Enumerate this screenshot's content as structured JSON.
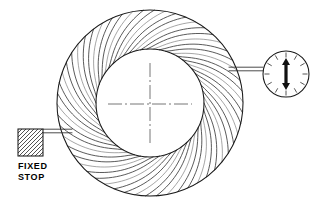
{
  "diagram": {
    "type": "mechanical-schematic",
    "canvas": {
      "width": 319,
      "height": 209,
      "background": "#ffffff"
    },
    "line_color": "#1a1a1a"
  },
  "wheel": {
    "name": "impeller-wheel",
    "center_x": 150,
    "center_y": 103,
    "outer_radius": 93,
    "inner_radius": 54,
    "vane_count": 54,
    "vane_sweep_degrees": 46,
    "vane_direction": "clockwise",
    "hub_label": ""
  },
  "centerline": {
    "name": "wheel-centerline-crosshair",
    "center_x": 150,
    "center_y": 104,
    "horizontal_half_length": 42,
    "vertical_half_length": 41,
    "style": "dash-dot"
  },
  "fixed_stop": {
    "label_line_1": "FIXED",
    "label_line_2": "STOP",
    "block_x": 18,
    "block_y": 129,
    "block_width": 25,
    "block_height": 27,
    "hatch_spacing": 4,
    "label_x": 18,
    "label_y": 169,
    "connector": {
      "name": "fixed-stop-connector-rod",
      "x1": 43,
      "x2": 72,
      "y": 131,
      "thickness": 3.6
    }
  },
  "gauge": {
    "name": "dial-indicator",
    "center_x": 286,
    "center_y": 74,
    "radius": 23,
    "tick_count": 12,
    "tick_length": 5,
    "indicator_type": "double-headed-vertical-arrow",
    "indicator_half_height": 16,
    "indicator_shaft_width": 3.2,
    "indicator_head_width": 8,
    "indicator_head_height": 7,
    "connector": {
      "name": "gauge-connector-rod",
      "x1": 229,
      "x2": 263,
      "y": 69,
      "thickness": 3.6
    }
  }
}
